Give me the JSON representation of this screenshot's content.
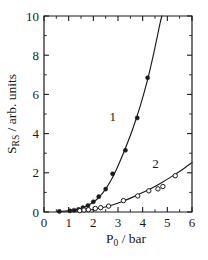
{
  "chart_data": {
    "type": "scatter",
    "title": "",
    "xlabel": "P_0 / bar",
    "xlabel_main": "P",
    "xlabel_sub": "0",
    "xlabel_rest": " / bar",
    "ylabel": "S_RS / arb. units",
    "ylabel_main": "S",
    "ylabel_sub": "RS",
    "ylabel_rest": " / arb. units",
    "xlim": [
      0,
      6
    ],
    "ylim": [
      0,
      10
    ],
    "xticks": [
      0,
      1,
      2,
      3,
      4,
      5,
      6
    ],
    "xtick_labels": [
      "0",
      "1",
      "2",
      "3",
      "4",
      "5",
      "6"
    ],
    "yticks": [
      0,
      2,
      4,
      6,
      8,
      10
    ],
    "ytick_labels": [
      "0",
      "2",
      "4",
      "6",
      "8",
      "10"
    ],
    "x_minor_interval": 0.5,
    "y_minor_interval": 1,
    "grid": false,
    "legend_position": "inline-annotations",
    "annotations": [
      {
        "text": "1",
        "x": 2.79,
        "y": 4.65
      },
      {
        "text": "2",
        "x": 4.52,
        "y": 2.25
      }
    ],
    "series": [
      {
        "name": "1",
        "marker": "filled-circle",
        "marker_color": "#1a1a1a",
        "points": [
          {
            "x": 0.62,
            "y": 0.03
          },
          {
            "x": 1.05,
            "y": 0.06
          },
          {
            "x": 1.22,
            "y": 0.09
          },
          {
            "x": 1.4,
            "y": 0.13
          },
          {
            "x": 1.58,
            "y": 0.22
          },
          {
            "x": 1.78,
            "y": 0.33
          },
          {
            "x": 2.0,
            "y": 0.52
          },
          {
            "x": 2.22,
            "y": 0.78
          },
          {
            "x": 2.5,
            "y": 1.17
          },
          {
            "x": 2.78,
            "y": 1.95
          },
          {
            "x": 3.3,
            "y": 3.15
          },
          {
            "x": 3.78,
            "y": 4.8
          },
          {
            "x": 4.2,
            "y": 6.85
          }
        ],
        "fit_curve": [
          {
            "x": 0.55,
            "y": 0.02
          },
          {
            "x": 1.0,
            "y": 0.06
          },
          {
            "x": 1.5,
            "y": 0.18
          },
          {
            "x": 1.8,
            "y": 0.34
          },
          {
            "x": 2.1,
            "y": 0.6
          },
          {
            "x": 2.4,
            "y": 1.0
          },
          {
            "x": 2.7,
            "y": 1.58
          },
          {
            "x": 3.0,
            "y": 2.35
          },
          {
            "x": 3.3,
            "y": 3.25
          },
          {
            "x": 3.6,
            "y": 4.25
          },
          {
            "x": 3.9,
            "y": 5.4
          },
          {
            "x": 4.2,
            "y": 6.75
          },
          {
            "x": 4.45,
            "y": 8.1
          },
          {
            "x": 4.7,
            "y": 9.6
          },
          {
            "x": 4.78,
            "y": 10.0
          }
        ]
      },
      {
        "name": "2",
        "marker": "open-circle",
        "marker_color": "#ffffff",
        "points": [
          {
            "x": 1.45,
            "y": 0.07
          },
          {
            "x": 1.62,
            "y": 0.1
          },
          {
            "x": 1.8,
            "y": 0.12
          },
          {
            "x": 2.08,
            "y": 0.18
          },
          {
            "x": 2.3,
            "y": 0.22
          },
          {
            "x": 2.62,
            "y": 0.3
          },
          {
            "x": 3.22,
            "y": 0.58
          },
          {
            "x": 3.8,
            "y": 0.82
          },
          {
            "x": 4.25,
            "y": 1.08
          },
          {
            "x": 4.62,
            "y": 1.18
          },
          {
            "x": 4.82,
            "y": 1.3
          },
          {
            "x": 5.32,
            "y": 1.85
          }
        ],
        "fit_curve": [
          {
            "x": 1.2,
            "y": 0.03
          },
          {
            "x": 1.6,
            "y": 0.07
          },
          {
            "x": 2.0,
            "y": 0.13
          },
          {
            "x": 2.4,
            "y": 0.23
          },
          {
            "x": 2.8,
            "y": 0.37
          },
          {
            "x": 3.2,
            "y": 0.55
          },
          {
            "x": 3.6,
            "y": 0.76
          },
          {
            "x": 4.0,
            "y": 0.99
          },
          {
            "x": 4.4,
            "y": 1.24
          },
          {
            "x": 4.8,
            "y": 1.52
          },
          {
            "x": 5.2,
            "y": 1.83
          },
          {
            "x": 5.6,
            "y": 2.16
          },
          {
            "x": 6.0,
            "y": 2.52
          }
        ]
      }
    ]
  },
  "plot_geometry": {
    "left": 44,
    "right": 192,
    "top": 16,
    "bottom": 212
  }
}
